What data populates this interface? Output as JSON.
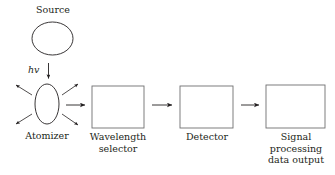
{
  "diagram": {
    "background_color": "#ffffff",
    "stroke_color": "#231f20",
    "text_color": "#231f20",
    "labels": {
      "source": "Source",
      "photon_energy": "hv",
      "atomizer": "Atomizer",
      "wavelength_selector_line1": "Wavelength",
      "wavelength_selector_line2": "selector",
      "detector": "Detector",
      "signal_line1": "Signal",
      "signal_line2": "processing",
      "signal_line3": "data output"
    },
    "shapes": {
      "source_circle": {
        "cx": 52.5,
        "cy": 38.5,
        "rx": 20.5,
        "ry": 16.5
      },
      "atomizer_ellipse": {
        "cx": 47,
        "cy": 104,
        "rx": 12,
        "ry": 20
      },
      "box_wavelength_selector": {
        "x": 92,
        "y": 86,
        "w": 52,
        "h": 42
      },
      "box_detector": {
        "x": 180,
        "y": 86,
        "w": 53,
        "h": 42
      },
      "box_signal": {
        "x": 266,
        "y": 85,
        "w": 59,
        "h": 43
      }
    },
    "arrows": {
      "photon_down": "hv downward arrow into atomizer",
      "atomizer_scatter": [
        "upper-left",
        "lower-left",
        "upper-right",
        "lower-right"
      ],
      "atomizer_to_wavelength": "horizontal arrow",
      "wavelength_to_detector": "horizontal arrow",
      "detector_to_signal": "horizontal arrow"
    }
  }
}
